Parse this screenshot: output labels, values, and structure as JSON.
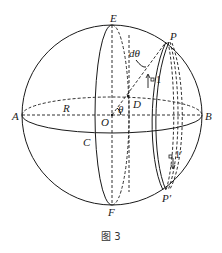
{
  "figure": {
    "caption": "图 3",
    "labels": {
      "E": "E",
      "F": "F",
      "A": "A",
      "B": "B",
      "C": "C",
      "D": "D",
      "O": "O",
      "R": "R",
      "P": "P",
      "P_prime": "P′",
      "theta": "θ",
      "d_theta": "dθ",
      "one": "1",
      "one_prime": "1′"
    },
    "colors": {
      "stroke": "#1a1a1a",
      "background": "#ffffff"
    }
  }
}
